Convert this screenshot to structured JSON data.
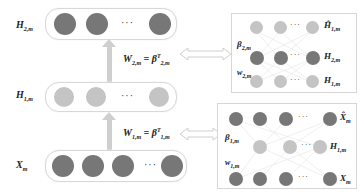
{
  "diagram": {
    "left_stack": {
      "layers": [
        {
          "name": "H_2m",
          "label_main": "H",
          "label_sub": "2,m",
          "node_shade": "dark",
          "nodes": 3
        },
        {
          "name": "H_1m",
          "label_main": "H",
          "label_sub": "1,m",
          "node_shade": "light",
          "nodes": 3
        },
        {
          "name": "X_m",
          "label_main": "X",
          "label_sub": "m",
          "node_shade": "dark",
          "nodes": 4
        }
      ],
      "ellipsis": "···",
      "weights": [
        {
          "w_main": "W",
          "w_sub": "2,m",
          "eq": "=",
          "b_main": "β",
          "b_sup": "T",
          "b_sub": "2,m"
        },
        {
          "w_main": "W",
          "w_sub": "1,m",
          "eq": "=",
          "b_main": "β",
          "b_sup": "T",
          "b_sub": "1,m"
        }
      ]
    },
    "right_panels": [
      {
        "name": "autoencoder-2",
        "top_label": {
          "main": "Ĥ",
          "sub": "1,m"
        },
        "mid_label": {
          "main": "H",
          "sub": "2,m"
        },
        "bottom_label": {
          "main": "H",
          "sub": "1,m"
        },
        "beta_label": {
          "main": "β",
          "sub": "2,m"
        },
        "w_label": {
          "main": "w",
          "sub": "2,m"
        },
        "ellipsis": "···"
      },
      {
        "name": "autoencoder-1",
        "top_label": {
          "main": "X̂",
          "sub": "m"
        },
        "mid_label": {
          "main": "H",
          "sub": "1,m"
        },
        "bottom_label": {
          "main": "X",
          "sub": "m"
        },
        "beta_label": {
          "main": "β",
          "sub": "1,m"
        },
        "w_label": {
          "main": "w",
          "sub": "1,m"
        },
        "ellipsis": "···"
      }
    ],
    "colors": {
      "dark_node": "#777777",
      "light_node": "#c4c4c4",
      "arrow": "#cfcfcf",
      "border": "#d8d8d8"
    }
  }
}
